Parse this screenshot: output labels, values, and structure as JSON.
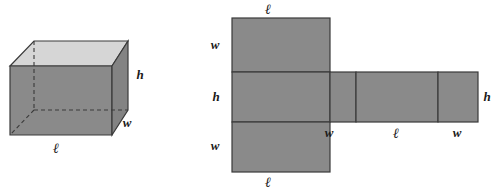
{
  "figure": {
    "kind": "geometry-illustration",
    "colors": {
      "face_front": "#8a8a8a",
      "face_side": "#848484",
      "face_top": "#d6d6d6",
      "net_fill": "#8a8a8a",
      "edge_stroke": "#3a3a3a",
      "hidden_edge_stroke": "#3a3a3a",
      "background": "#ffffff",
      "label_color": "#1a1a1a"
    },
    "symbols": {
      "length": "ℓ",
      "width": "w",
      "height": "h"
    },
    "prism": {
      "name": "rectangular-prism",
      "labels": [
        {
          "id": "prism-height",
          "text": "h",
          "x": 140,
          "y": 79
        },
        {
          "id": "prism-width",
          "text": "w",
          "x": 127,
          "y": 127
        },
        {
          "id": "prism-length",
          "text": "ℓ",
          "x": 56,
          "y": 153
        }
      ]
    },
    "net": {
      "name": "prism-net",
      "faces": [
        {
          "id": "net-top-face",
          "x": 232,
          "y": 18,
          "w": 98,
          "h": 54
        },
        {
          "id": "net-left-face",
          "x": 232,
          "y": 72,
          "w": 98,
          "h": 50
        },
        {
          "id": "net-bottom-face",
          "x": 232,
          "y": 122,
          "w": 98,
          "h": 50
        },
        {
          "id": "net-middle-face-a",
          "x": 330,
          "y": 72,
          "w": 26,
          "h": 50
        },
        {
          "id": "net-middle-face-b",
          "x": 356,
          "y": 72,
          "w": 82,
          "h": 50
        },
        {
          "id": "net-middle-face-c",
          "x": 438,
          "y": 72,
          "w": 40,
          "h": 50
        }
      ],
      "labels": [
        {
          "id": "net-top-length",
          "text": "ℓ",
          "x": 268,
          "y": 14
        },
        {
          "id": "net-left-upper-width",
          "text": "w",
          "x": 215,
          "y": 49
        },
        {
          "id": "net-left-height",
          "text": "h",
          "x": 216,
          "y": 101
        },
        {
          "id": "net-left-lower-width",
          "text": "w",
          "x": 215,
          "y": 150
        },
        {
          "id": "net-bottom-length",
          "text": "ℓ",
          "x": 268,
          "y": 186
        },
        {
          "id": "net-strip-width-left",
          "text": "w",
          "x": 329,
          "y": 136
        },
        {
          "id": "net-strip-length",
          "text": "ℓ",
          "x": 396,
          "y": 137
        },
        {
          "id": "net-strip-width-right",
          "text": "w",
          "x": 457,
          "y": 136
        },
        {
          "id": "net-right-height",
          "text": "h",
          "x": 486,
          "y": 101
        }
      ]
    }
  }
}
